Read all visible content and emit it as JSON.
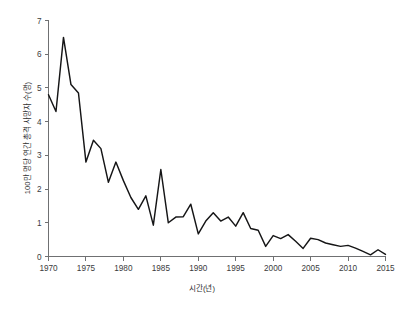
{
  "chart_data": {
    "type": "line",
    "title": "",
    "xlabel": "시간(년)",
    "ylabel": "100만 명당 연간 총격 사망자 수(명)",
    "xlim": [
      1970,
      2015
    ],
    "ylim": [
      0,
      7
    ],
    "grid": false,
    "legend": null,
    "xticks": [
      1970,
      1975,
      1980,
      1985,
      1990,
      1995,
      2000,
      2005,
      2010,
      2015
    ],
    "xtick_labels": [
      "1970",
      "1975",
      "1980",
      "1985",
      "1990",
      "1995",
      "2000",
      "2005",
      "2010",
      "2015"
    ],
    "yticks": [
      0,
      1,
      2,
      3,
      4,
      5,
      6,
      7
    ],
    "ytick_labels": [
      "0",
      "1",
      "2",
      "3",
      "4",
      "5",
      "6",
      "7"
    ],
    "line_color": "#151516",
    "axis_color": "#6f7072",
    "background_color": "#ffffff",
    "x": [
      1970,
      1971,
      1972,
      1973,
      1974,
      1975,
      1976,
      1977,
      1978,
      1979,
      1980,
      1981,
      1982,
      1983,
      1984,
      1985,
      1986,
      1987,
      1988,
      1989,
      1990,
      1991,
      1992,
      1993,
      1994,
      1995,
      1996,
      1997,
      1998,
      1999,
      2000,
      2001,
      2002,
      2003,
      2004,
      2005,
      2006,
      2007,
      2008,
      2009,
      2010,
      2011,
      2012,
      2013,
      2014,
      2015
    ],
    "values": [
      4.8,
      4.3,
      6.5,
      5.1,
      4.85,
      2.8,
      3.45,
      3.2,
      2.2,
      2.8,
      2.25,
      1.75,
      1.4,
      1.8,
      0.93,
      2.58,
      1.0,
      1.17,
      1.18,
      1.55,
      0.67,
      1.05,
      1.3,
      1.05,
      1.17,
      0.9,
      1.3,
      0.83,
      0.78,
      0.3,
      0.62,
      0.53,
      0.65,
      0.45,
      0.24,
      0.54,
      0.5,
      0.4,
      0.35,
      0.3,
      0.33,
      0.25,
      0.15,
      0.05,
      0.2,
      0.06
    ]
  }
}
